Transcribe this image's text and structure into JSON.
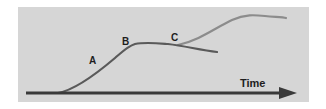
{
  "diagram": {
    "type": "growth-curves",
    "axis": {
      "label": "Time",
      "direction": "right"
    },
    "points": [
      {
        "id": "A",
        "label": "A"
      },
      {
        "id": "B",
        "label": "B"
      },
      {
        "id": "C",
        "label": "C"
      }
    ],
    "curves": [
      {
        "name": "declining-curve",
        "description": "S-curve rising through A to plateau at B, then declining after C"
      },
      {
        "name": "renewed-growth-curve",
        "description": "Curve branching at C and rising to a higher plateau"
      }
    ],
    "colors": {
      "background": "#d6d6d6",
      "axis": "#3a3a3a",
      "declining_curve": "#5a5a5a",
      "renewed_curve": "#8c8c8c",
      "text": "#1e1e1e"
    }
  }
}
